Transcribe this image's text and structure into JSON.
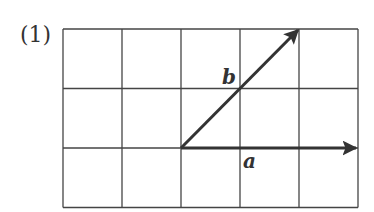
{
  "problem": {
    "number_label": "(1)"
  },
  "grid": {
    "columns": 5,
    "rows": 3,
    "left": 63,
    "top": 29,
    "cell_w": 59,
    "cell_h": 59.5,
    "line_color": "#444444"
  },
  "vectors": [
    {
      "name": "a",
      "label": "a",
      "from": [
        2,
        0
      ],
      "to": [
        5,
        0
      ],
      "components": [
        3,
        0
      ]
    },
    {
      "name": "b",
      "label": "b",
      "from": [
        2,
        0
      ],
      "to": [
        4,
        2
      ],
      "components": [
        2,
        2
      ]
    }
  ],
  "colors": {
    "vector": "#333333",
    "text": "#333333"
  }
}
